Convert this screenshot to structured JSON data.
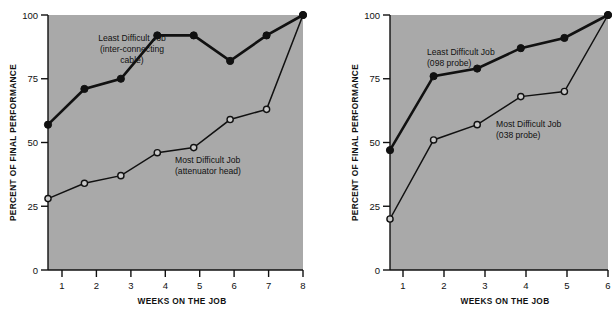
{
  "figure": {
    "background": "#ffffff",
    "plot_background": "#a9a9a9",
    "ink": "#111111"
  },
  "chart_data": [
    {
      "type": "line",
      "panel": "left",
      "title": "",
      "xlabel": "WEEKS ON THE JOB",
      "ylabel": "PERCENT OF FINAL PERFORMANCE",
      "x": [
        1,
        2,
        3,
        4,
        5,
        6,
        7,
        8
      ],
      "xticklabels": [
        "1",
        "2",
        "3",
        "4",
        "5",
        "6",
        "7",
        "8"
      ],
      "yticks": [
        0,
        25,
        50,
        75,
        100
      ],
      "yticklabels": [
        "0",
        "25",
        "50",
        "75",
        "100"
      ],
      "xlim": [
        0.6,
        8.4
      ],
      "ylim": [
        0,
        100
      ],
      "grid": false,
      "legend": "annotations-inline",
      "series": [
        {
          "name": "Least Difficult Job (inter-connecting cable)",
          "marker": "filled-circle",
          "values": [
            57,
            71,
            75,
            92,
            92,
            82,
            92,
            100
          ],
          "annotation": {
            "lines": [
              "Least Difficult Job",
              "(inter-connecting",
              "cable)"
            ],
            "align": "center"
          }
        },
        {
          "name": "Most Difficult Job (attenuator head)",
          "marker": "open-circle",
          "values": [
            28,
            34,
            37,
            46,
            48,
            59,
            63,
            100
          ],
          "annotation": {
            "lines": [
              "Most Difficult Job",
              "(attenuator head)"
            ],
            "align": "start"
          }
        }
      ]
    },
    {
      "type": "line",
      "panel": "right",
      "title": "",
      "xlabel": "WEEKS ON THE JOB",
      "ylabel": "PERCENT OF FINAL PERFORMANCE",
      "x": [
        1,
        2,
        3,
        4,
        5,
        6
      ],
      "xticklabels": [
        "1",
        "2",
        "3",
        "4",
        "5",
        "6"
      ],
      "yticks": [
        0,
        25,
        50,
        75,
        100
      ],
      "yticklabels": [
        "0",
        "25",
        "50",
        "75",
        "100"
      ],
      "xlim": [
        0.6,
        6.4
      ],
      "ylim": [
        0,
        100
      ],
      "grid": false,
      "legend": "annotations-inline",
      "series": [
        {
          "name": "Least Difficult Job (098 probe)",
          "marker": "filled-circle",
          "values": [
            47,
            76,
            79,
            87,
            91,
            100
          ],
          "annotation": {
            "lines": [
              "Least Difficult Job",
              "(098 probe)"
            ],
            "align": "start"
          }
        },
        {
          "name": "Most Difficult Job (038 probe)",
          "marker": "open-circle",
          "values": [
            20,
            51,
            57,
            68,
            70,
            100
          ],
          "annotation": {
            "lines": [
              "Most Difficult Job",
              "(038 probe)"
            ],
            "align": "start"
          }
        }
      ]
    }
  ],
  "left_chart": {
    "ylabel": "PERCENT OF FINAL PERFORMANCE",
    "xlabel": "WEEKS ON THE JOB",
    "yticklabels": [
      "0",
      "25",
      "50",
      "75",
      "100"
    ],
    "xticklabels": [
      "1",
      "2",
      "3",
      "4",
      "5",
      "6",
      "7",
      "8"
    ],
    "annot_least_1": "Least Difficult Job",
    "annot_least_2": "(inter-connecting",
    "annot_least_3": "cable)",
    "annot_most_1": "Most Difficult Job",
    "annot_most_2": "(attenuator head)"
  },
  "right_chart": {
    "ylabel": "PERCENT OF FINAL PERFORMANCE",
    "xlabel": "WEEKS ON THE JOB",
    "yticklabels": [
      "0",
      "25",
      "50",
      "75",
      "100"
    ],
    "xticklabels": [
      "1",
      "2",
      "3",
      "4",
      "5",
      "6"
    ],
    "annot_least_1": "Least Difficult Job",
    "annot_least_2": "(098 probe)",
    "annot_most_1": "Most Difficult Job",
    "annot_most_2": "(038 probe)"
  }
}
